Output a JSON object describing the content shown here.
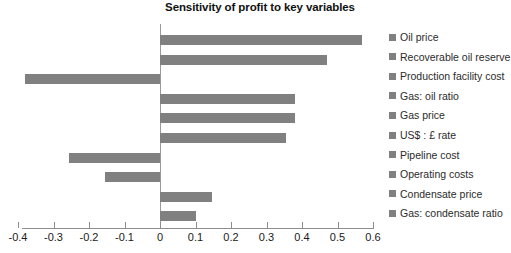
{
  "chart_data": {
    "type": "bar",
    "orientation": "horizontal",
    "title": "Sensitivity of profit to key variables",
    "xlabel": "",
    "ylabel": "",
    "xlim": [
      -0.4,
      0.6
    ],
    "xticks": [
      -0.4,
      -0.3,
      -0.2,
      -0.1,
      0,
      0.1,
      0.2,
      0.3,
      0.4,
      0.5,
      0.6
    ],
    "xticklabels": [
      "-0.4",
      "-0.3",
      "-0.2",
      "-0.1",
      "0",
      "0.1",
      "0.2",
      "0.3",
      "0.4",
      "0.5",
      "0.6"
    ],
    "grid": false,
    "legend_position": "right",
    "bar_color": "#808080",
    "categories": [
      "Oil price",
      "Recoverable oil reserve",
      "Production facility cost",
      "Gas: oil ratio",
      "Gas price",
      "US$ : £ rate",
      "Pipeline cost",
      "Operating costs",
      "Condensate price",
      "Gas: condensate ratio"
    ],
    "values": [
      0.57,
      0.47,
      -0.38,
      0.38,
      0.38,
      0.355,
      -0.255,
      -0.155,
      0.147,
      0.1
    ]
  },
  "legend": {
    "items": [
      {
        "label": "Oil price",
        "color": "#808080"
      },
      {
        "label": "Recoverable oil reserve",
        "color": "#808080"
      },
      {
        "label": "Production facility cost",
        "color": "#808080"
      },
      {
        "label": "Gas: oil ratio",
        "color": "#808080"
      },
      {
        "label": "Gas price",
        "color": "#808080"
      },
      {
        "label": "US$ : £ rate",
        "color": "#808080"
      },
      {
        "label": "Pipeline cost",
        "color": "#808080"
      },
      {
        "label": "Operating costs",
        "color": "#808080"
      },
      {
        "label": "Condensate price",
        "color": "#808080"
      },
      {
        "label": "Gas: condensate ratio",
        "color": "#808080"
      }
    ]
  },
  "axis": {
    "line_color": "#8d8d8d",
    "zero_line_color": "#9a9a9a"
  }
}
